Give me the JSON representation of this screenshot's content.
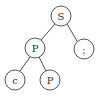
{
  "diagram": {
    "type": "tree",
    "nodes": [
      {
        "id": "n0",
        "label": "S",
        "cx": 61,
        "cy": 16,
        "r": 10
      },
      {
        "id": "n1",
        "label": "P",
        "cx": 35,
        "cy": 48,
        "r": 10
      },
      {
        "id": "n2",
        "label": ";",
        "cx": 84,
        "cy": 49,
        "r": 10
      },
      {
        "id": "n3",
        "label": "c",
        "cx": 15,
        "cy": 80,
        "r": 10
      },
      {
        "id": "n4",
        "label": "P",
        "cx": 50,
        "cy": 80,
        "r": 10
      }
    ],
    "edges": [
      {
        "from": "n0",
        "to": "n1"
      },
      {
        "from": "n0",
        "to": "n2"
      },
      {
        "from": "n1",
        "to": "n3"
      },
      {
        "from": "n1",
        "to": "n4"
      }
    ],
    "colors": {
      "stroke": "#555555",
      "text": "#333333",
      "background": "#ffffff"
    }
  }
}
